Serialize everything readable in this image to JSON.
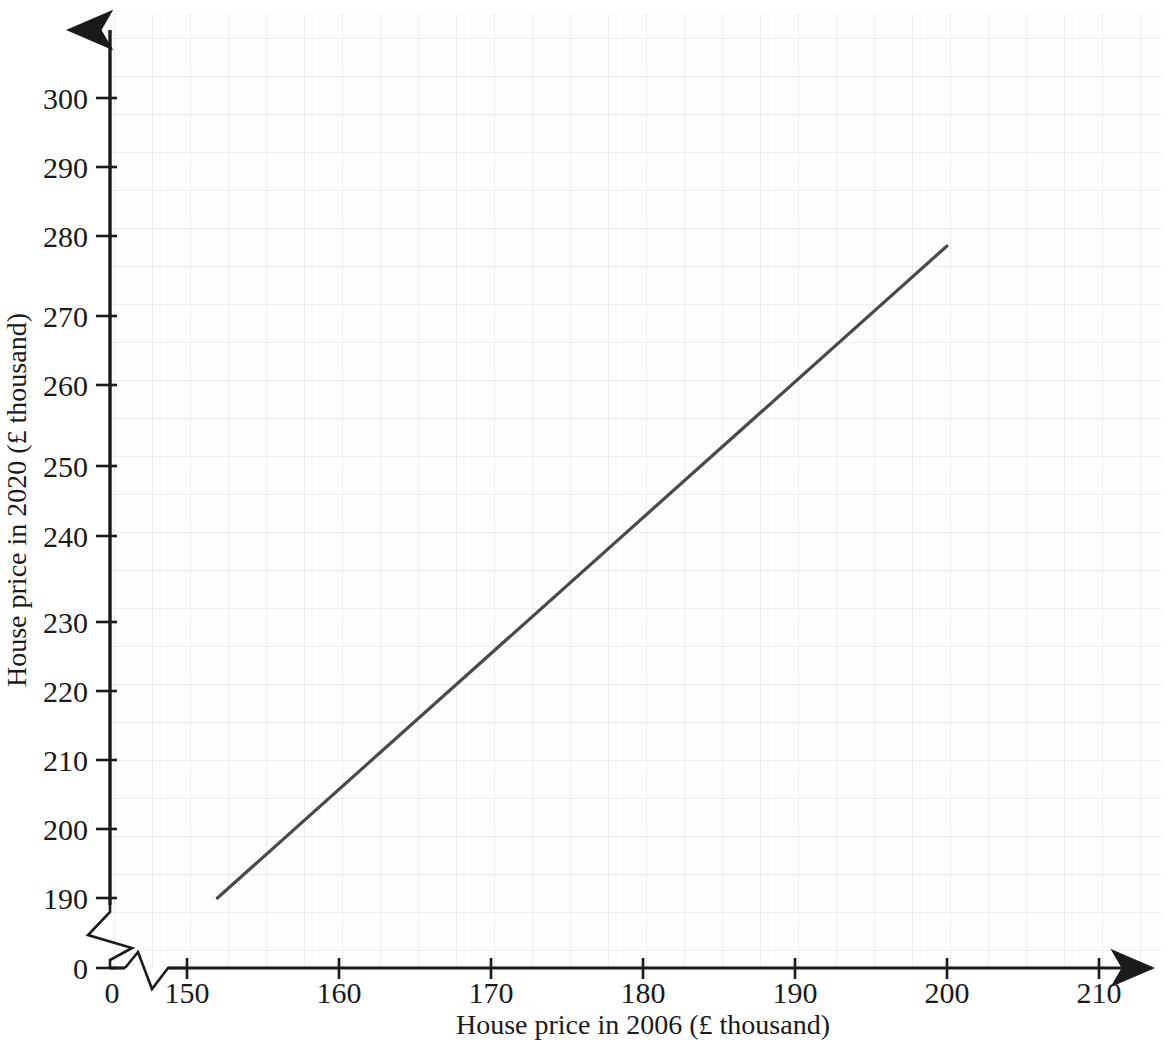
{
  "chart_data": {
    "type": "line",
    "title": "",
    "xlabel": "House price in 2006 (£ thousand)",
    "ylabel": "House price in 2020 (£ thousand)",
    "xlim": [
      150,
      214
    ],
    "ylim": [
      188,
      306
    ],
    "x_ticks": [
      "0",
      "150",
      "160",
      "170",
      "180",
      "190",
      "200",
      "210"
    ],
    "y_ticks": [
      "0",
      "190",
      "200",
      "210",
      "220",
      "230",
      "240",
      "250",
      "260",
      "270",
      "280",
      "290",
      "300"
    ],
    "x_axis_break": true,
    "y_axis_break": true,
    "grid": true,
    "grid_minor": true,
    "legend": "none",
    "series": [
      {
        "name": "line-of-best-fit",
        "type": "line",
        "color": "#4a4a4a",
        "x": [
          152,
          200
        ],
        "y": [
          190,
          284.5
        ]
      }
    ],
    "annotations": []
  },
  "axes": {
    "x_tick_values": [
      0,
      150,
      160,
      170,
      180,
      190,
      200,
      210
    ],
    "y_tick_values": [
      0,
      190,
      200,
      210,
      220,
      230,
      240,
      250,
      260,
      270,
      280,
      290,
      300
    ],
    "x_title": "House price in 2006 (£ thousand)",
    "y_title": "House price in 2020 (£ thousand)"
  },
  "colors": {
    "line": "#4a4a4a",
    "axis": "#1a1a1a",
    "grid_major": "#e4e4e6",
    "grid_minor": "#f1f1f3",
    "text": "#1a1a1a",
    "background": "#ffffff"
  },
  "labels": {
    "x_0": "0",
    "x_150": "150",
    "x_160": "160",
    "x_170": "170",
    "x_180": "180",
    "x_190": "190",
    "x_200": "200",
    "x_210": "210",
    "y_0": "0",
    "y_190": "190",
    "y_200": "200",
    "y_210": "210",
    "y_220": "220",
    "y_230": "230",
    "y_240": "240",
    "y_250": "250",
    "y_260": "260",
    "y_270": "270",
    "y_280": "280",
    "y_290": "290",
    "y_300": "300"
  }
}
